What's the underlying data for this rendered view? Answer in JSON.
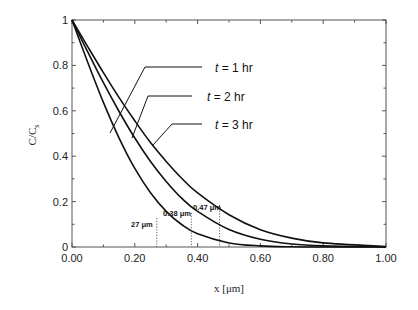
{
  "chart_data": {
    "type": "line",
    "title": "",
    "xlabel": "x  [μm]",
    "ylabel": "C/C",
    "ylabel_subscript": "s",
    "xlim": [
      0,
      1
    ],
    "ylim": [
      0,
      1
    ],
    "grid": false,
    "x_ticks": [
      "0.00",
      "0.20",
      "0.40",
      "0.60",
      "0.80",
      "1.00"
    ],
    "y_ticks": [
      "0",
      "0.2",
      "0.4",
      "0.6",
      "0.8",
      "1"
    ],
    "x": [
      0,
      0.05,
      0.1,
      0.15,
      0.2,
      0.25,
      0.3,
      0.35,
      0.4,
      0.5,
      0.6,
      0.7,
      0.8,
      1.0
    ],
    "series": [
      {
        "name": "t = 1 hr",
        "values": [
          1,
          0.814,
          0.637,
          0.48,
          0.346,
          0.239,
          0.157,
          0.098,
          0.058,
          0.018,
          0.005,
          0.001,
          0,
          0
        ]
      },
      {
        "name": "t = 2 hr",
        "values": [
          1,
          0.86,
          0.724,
          0.597,
          0.48,
          0.377,
          0.289,
          0.214,
          0.157,
          0.077,
          0.034,
          0.013,
          0.005,
          0
        ]
      },
      {
        "name": "t = 3 hr",
        "values": [
          1,
          0.883,
          0.768,
          0.658,
          0.556,
          0.46,
          0.377,
          0.302,
          0.238,
          0.142,
          0.076,
          0.039,
          0.018,
          0.002
        ]
      }
    ],
    "legend": [
      {
        "label": "t = 1 hr",
        "italic_var": "t",
        "rest": " = 1 hr"
      },
      {
        "label": "t = 2 hr",
        "italic_var": "t",
        "rest": " = 2 hr"
      },
      {
        "label": "t = 3 hr",
        "italic_var": "t",
        "rest": " = 3 hr"
      }
    ],
    "annotations": [
      {
        "label": "27 μm",
        "x": 0.27
      },
      {
        "label": "0.38 μm",
        "x": 0.38
      },
      {
        "label": "0.47 μm",
        "x": 0.47
      }
    ],
    "line_color": "#111111"
  }
}
